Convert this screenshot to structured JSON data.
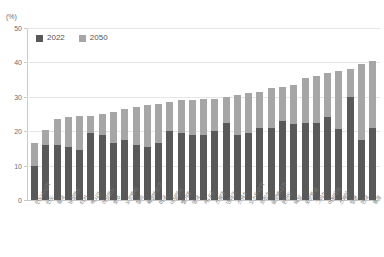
{
  "chart_data": {
    "type": "bar",
    "subtype": "stacked-bar",
    "title": "",
    "subtitle": "",
    "unit_label": "(%)",
    "xlabel": "",
    "ylabel": "",
    "ylim": [
      0,
      50
    ],
    "yticks": [
      0,
      10,
      20,
      30,
      40,
      50
    ],
    "ytick_labels": [
      "0",
      "10",
      "20",
      "30",
      "40",
      "50"
    ],
    "grid": true,
    "legend_position": "top-left",
    "categories": [
      "인도네시아",
      "인도",
      "중국",
      "뉴질랜드",
      "터키",
      "멕시코",
      "아일랜드",
      "호주",
      "노르웨이",
      "칠레",
      "룩셈부르크",
      "미국",
      "네덜란드",
      "벨기에",
      "영국",
      "캐나다",
      "스웨덴",
      "덴마크",
      "스위스",
      "오스트리아",
      "프랑스",
      "슬로베니아",
      "핀란드",
      "독일",
      "포르투갈",
      "그리스",
      "이탈리아",
      "스페인",
      "일본",
      "한국",
      "홍콩"
    ],
    "series": [
      {
        "name": "2022",
        "color": "#595959",
        "values": [
          10.0,
          16.0,
          16.0,
          15.5,
          14.5,
          19.5,
          19.0,
          16.5,
          17.5,
          16.0,
          15.5,
          16.5,
          20.0,
          19.5,
          19.0,
          19.0,
          20.0,
          22.5,
          19.0,
          19.5,
          21.0,
          21.0,
          23.0,
          22.0,
          22.5,
          22.5,
          24.0,
          20.5,
          30.0,
          17.5,
          21.0
        ]
      },
      {
        "name": "2050",
        "color": "#a6a6a6",
        "values": [
          16.5,
          20.5,
          23.5,
          24.0,
          24.5,
          24.5,
          25.0,
          25.5,
          26.5,
          27.0,
          27.5,
          28.0,
          28.5,
          29.0,
          29.0,
          29.5,
          29.5,
          30.0,
          30.5,
          31.0,
          31.5,
          32.5,
          33.0,
          33.5,
          35.5,
          36.0,
          37.0,
          37.5,
          38.0,
          39.5,
          40.5
        ]
      }
    ],
    "legend_entries": [
      "2022",
      "2050"
    ],
    "colors": {
      "series_2022": "#595959",
      "series_2050": "#a6a6a6",
      "axis": "#c9c9c9",
      "gridline": "#e6e6e6",
      "tick_text": "#6d6d6d",
      "label_text": "#7a7a7a",
      "background": "#ffffff"
    }
  }
}
